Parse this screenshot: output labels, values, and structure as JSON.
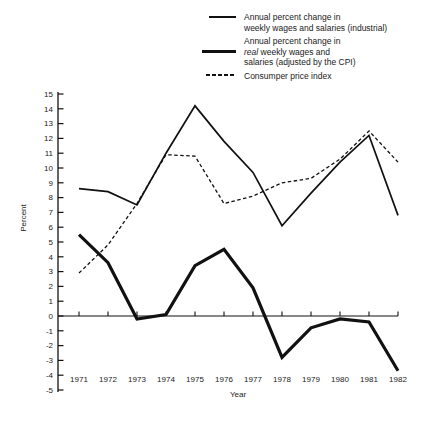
{
  "legend": {
    "items": [
      {
        "swatch": "thin-solid",
        "line1": "Annual percent change in",
        "line2": "weekly wages and salaries (industrial)"
      },
      {
        "swatch": "thick-solid",
        "line1": "Annual percent change in",
        "line2_italic": "real",
        "line2_rest": " weekly wages and",
        "line3": "salaries (adjusted by the CPI)"
      },
      {
        "swatch": "dashed",
        "line1": "Consumper price index"
      }
    ]
  },
  "axes": {
    "ylabel": "Percent",
    "xlabel": "Year"
  },
  "chart_data": {
    "type": "line",
    "title": "",
    "xlabel": "Year",
    "ylabel": "Percent",
    "x": [
      1971,
      1972,
      1973,
      1974,
      1975,
      1976,
      1977,
      1978,
      1979,
      1980,
      1981,
      1982
    ],
    "ylim": [
      -5,
      15
    ],
    "ytick_step": 1,
    "grid": false,
    "zero_line": true,
    "legend_position": "top-right",
    "line_color": "#111111",
    "series": [
      {
        "name": "Annual percent change in weekly wages and salaries (industrial)",
        "style": "thin-solid",
        "values": [
          8.6,
          8.4,
          7.5,
          11.0,
          14.2,
          11.8,
          9.7,
          6.1,
          8.3,
          10.4,
          12.2,
          6.8
        ]
      },
      {
        "name": "Annual percent change in real weekly wages and salaries (adjusted by the CPI)",
        "style": "thick-solid",
        "values": [
          5.5,
          3.6,
          -0.2,
          0.1,
          3.4,
          4.5,
          1.9,
          -2.8,
          -0.8,
          -0.2,
          -0.4,
          -3.7
        ]
      },
      {
        "name": "Consumper price index",
        "style": "dashed",
        "values": [
          2.9,
          4.8,
          7.6,
          10.9,
          10.8,
          7.6,
          8.1,
          9.0,
          9.3,
          10.6,
          12.5,
          10.4
        ]
      }
    ]
  }
}
